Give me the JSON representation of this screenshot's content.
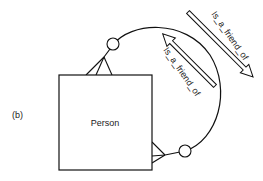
{
  "figure_label": "(b)",
  "entity": {
    "name": "Person"
  },
  "relationship": {
    "forward_label": "Is_a_friend_of",
    "reverse_label": "Is_a_friend_of"
  },
  "colors": {
    "stroke": "#111111",
    "text": "#222222",
    "background": "#ffffff"
  }
}
